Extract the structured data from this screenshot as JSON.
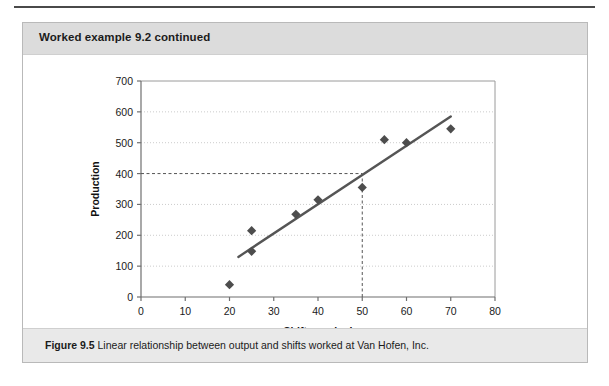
{
  "header": {
    "title": "Worked example 9.2 continued"
  },
  "caption": {
    "label": "Figure 9.5",
    "text": "Linear relationship between output and shifts worked at Van Hofen, Inc."
  },
  "colors": {
    "header_band": "#dcdcdc",
    "caption_band": "#e9e9e9",
    "box_border": "#b9b9b9",
    "marker": "#4d4d4d",
    "trend_line": "#555555",
    "grid": "#cccccc",
    "reference_line": "#555555",
    "axis": "#888888",
    "top_rule": "#4a4a4a"
  },
  "chart_data": {
    "type": "scatter",
    "title": "",
    "xlabel": "Shifts worked",
    "ylabel": "Production",
    "xlim": [
      0,
      80
    ],
    "ylim": [
      0,
      700
    ],
    "xticks": [
      0,
      10,
      20,
      30,
      40,
      50,
      60,
      70,
      80
    ],
    "yticks": [
      0,
      100,
      200,
      300,
      400,
      500,
      600,
      700
    ],
    "grid": true,
    "grid_style": "dotted-horizontal",
    "legend": "none",
    "points": [
      {
        "x": 20,
        "y": 40
      },
      {
        "x": 25,
        "y": 215
      },
      {
        "x": 25,
        "y": 148
      },
      {
        "x": 35,
        "y": 268
      },
      {
        "x": 40,
        "y": 315
      },
      {
        "x": 50,
        "y": 355
      },
      {
        "x": 55,
        "y": 510
      },
      {
        "x": 60,
        "y": 500
      },
      {
        "x": 70,
        "y": 545
      }
    ],
    "trend_line": {
      "x_start": 22,
      "y_start": 130,
      "x_end": 70,
      "y_end": 585
    },
    "reference_lines": [
      {
        "orientation": "horizontal",
        "value": 400,
        "from": 0,
        "to": 50,
        "style": "dashed"
      },
      {
        "orientation": "vertical",
        "value": 50,
        "from": 0,
        "to": 400,
        "style": "dashed"
      }
    ]
  }
}
